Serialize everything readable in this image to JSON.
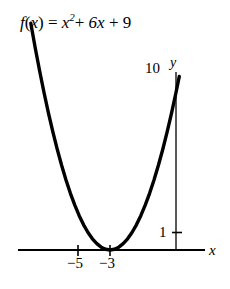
{
  "figure": {
    "equation_parts": {
      "fn": "f",
      "open": "(",
      "var": "x",
      "close": ")",
      "equals": "=",
      "base": "x",
      "exponent": "2",
      "plus1": "+",
      "term2": "6x",
      "plus2": "+",
      "term3": "9"
    },
    "equation_text": "f(x) = x2 + 6x + 9"
  },
  "chart_data": {
    "type": "line",
    "xlabel": "x",
    "ylabel": "y",
    "function": "f(x) = x^2 + 6x + 9",
    "vertex": [
      -3,
      0
    ],
    "y_intercept": [
      0,
      9
    ],
    "roots": [
      -3
    ],
    "xlim": [
      -7.5,
      1.6
    ],
    "ylim": [
      -1,
      11
    ],
    "grid": false,
    "legend": null,
    "x_ticks": [
      {
        "value": -5,
        "label": "−5"
      },
      {
        "value": -3,
        "label": "−3"
      }
    ],
    "y_ticks": [
      {
        "value": 1,
        "label": "1"
      },
      {
        "value": 10,
        "label": "10"
      }
    ],
    "axis_labels": {
      "x": "x",
      "y": "y"
    },
    "x": [
      -6.6,
      -6.4,
      -6.2,
      -6.0,
      -5.8,
      -5.6,
      -5.4,
      -5.2,
      -5.0,
      -4.8,
      -4.6,
      -4.4,
      -4.2,
      -4.0,
      -3.8,
      -3.6,
      -3.4,
      -3.2,
      -3.0,
      -2.8,
      -2.6,
      -2.4,
      -2.2,
      -2.0,
      -1.8,
      -1.6,
      -1.4,
      -1.2,
      -1.0,
      -0.8,
      -0.6,
      -0.4,
      -0.2,
      0.0,
      0.15
    ],
    "y": [
      12.96,
      11.56,
      10.24,
      9.0,
      7.84,
      6.76,
      5.76,
      4.84,
      4.0,
      3.24,
      2.56,
      1.96,
      1.44,
      1.0,
      0.64,
      0.36,
      0.16,
      0.04,
      0.0,
      0.04,
      0.16,
      0.36,
      0.64,
      1.0,
      1.44,
      1.96,
      2.56,
      3.24,
      4.0,
      4.84,
      5.76,
      6.76,
      7.84,
      9.0,
      9.92
    ]
  }
}
